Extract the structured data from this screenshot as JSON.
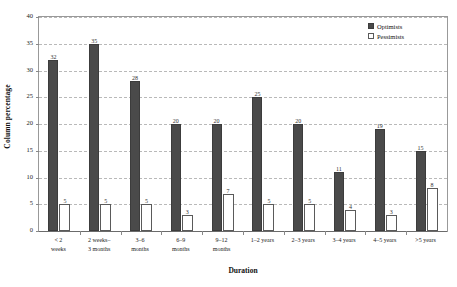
{
  "chart_data": {
    "type": "bar",
    "title": "",
    "xlabel": "Duration",
    "ylabel": "Column percentage",
    "ylim": [
      0,
      40
    ],
    "yticks": [
      0,
      5,
      10,
      15,
      20,
      25,
      30,
      35,
      40
    ],
    "grid": true,
    "legend_position": "top-right",
    "categories": [
      "< 2 weeks",
      "2 weeks– 3 months",
      "3–6 months",
      "6–9 months",
      "9–12 months",
      "1–2 years",
      "2–3 years",
      "3–4 years",
      "4–5 years",
      ">5 years"
    ],
    "category_lines": [
      [
        "< 2",
        "weeks"
      ],
      [
        "2 weeks–",
        "3 months"
      ],
      [
        "3–6",
        "months"
      ],
      [
        "6–9",
        "months"
      ],
      [
        "9–12",
        "months"
      ],
      [
        "1–2 years",
        ""
      ],
      [
        "2–3 years",
        ""
      ],
      [
        "3–4 years",
        ""
      ],
      [
        "4–5 years",
        ""
      ],
      [
        ">5 years",
        ""
      ]
    ],
    "series": [
      {
        "name": "Optimists",
        "color": "#4a4a4a",
        "values": [
          32,
          35,
          28,
          20,
          20,
          25,
          20,
          11,
          19,
          15
        ]
      },
      {
        "name": "Pessimists",
        "color": "#ffffff",
        "values": [
          5,
          5,
          5,
          3,
          7,
          5,
          5,
          4,
          3,
          8
        ]
      }
    ]
  },
  "legend": {
    "items": [
      {
        "label": "Optimists",
        "swatch": "filled-square-icon"
      },
      {
        "label": "Pessimists",
        "swatch": "outlined-square-icon"
      }
    ]
  },
  "axes": {
    "y_title": "Column percentage",
    "x_title": "Duration"
  },
  "colors": {
    "optimists": "#4a4a4a",
    "pessimists": "#ffffff",
    "grid": "#b9b9b9",
    "axis": "#999999",
    "text": "#1a1a1a"
  }
}
